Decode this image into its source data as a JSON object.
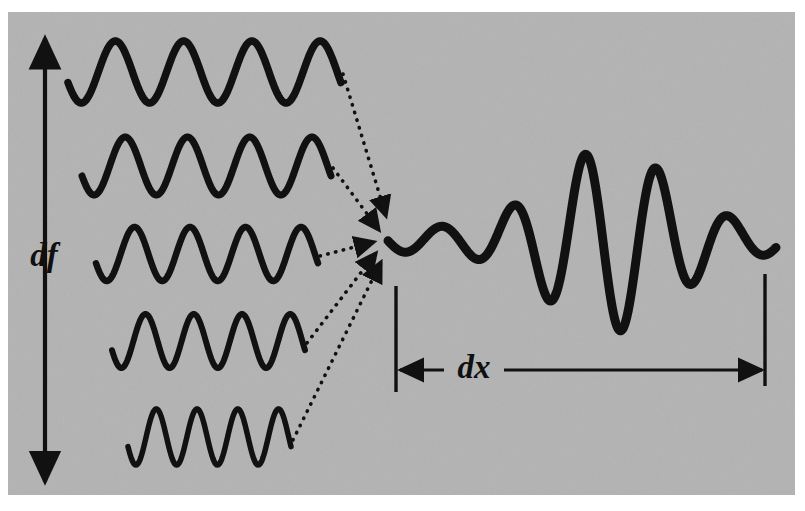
{
  "figure": {
    "background_color": "#b3b3b3",
    "ink_color": "#111111",
    "page_color": "#ffffff",
    "canvas": {
      "width": 805,
      "height": 511
    },
    "plate": {
      "x": 8,
      "y": 12,
      "width": 787,
      "height": 483
    }
  },
  "labels": {
    "df": "df",
    "dx": "dx"
  },
  "annotations": {
    "df_axis": {
      "name": "frequency-spread-axis",
      "orientation": "vertical",
      "double_headed": true,
      "x": 45,
      "y_top": 38,
      "y_bottom": 482,
      "label": "df",
      "label_x": 44,
      "label_y": 266
    },
    "dx_axis": {
      "name": "position-spread-axis",
      "orientation": "horizontal",
      "double_headed": true,
      "y": 370,
      "x_left": 400,
      "x_right": 762,
      "label": "dx",
      "label_x": 474,
      "label_y": 378,
      "tick_left": {
        "x": 396,
        "y_top": 286,
        "y_bottom": 392
      },
      "tick_right": {
        "x": 765,
        "y_top": 274,
        "y_bottom": 386
      }
    }
  },
  "component_waves": [
    {
      "name": "component-wave-1",
      "x_start": 68,
      "x_end": 341,
      "y_center": 72,
      "amplitude": 31,
      "cycles": 4.0,
      "phase_deg": 200,
      "stroke_width": 7.5
    },
    {
      "name": "component-wave-2",
      "x_start": 82,
      "x_end": 331,
      "y_center": 166,
      "amplitude": 29,
      "cycles": 4.0,
      "phase_deg": 200,
      "stroke_width": 7.0
    },
    {
      "name": "component-wave-3",
      "x_start": 96,
      "x_end": 318,
      "y_center": 254,
      "amplitude": 27,
      "cycles": 4.0,
      "phase_deg": 200,
      "stroke_width": 6.5
    },
    {
      "name": "component-wave-4",
      "x_start": 112,
      "x_end": 305,
      "y_center": 341,
      "amplitude": 27,
      "cycles": 4.0,
      "phase_deg": 200,
      "stroke_width": 6.0
    },
    {
      "name": "component-wave-5",
      "x_start": 128,
      "x_end": 291,
      "y_center": 437,
      "amplitude": 28,
      "cycles": 4.0,
      "phase_deg": 200,
      "stroke_width": 5.5
    }
  ],
  "dotted_arrows": [
    {
      "name": "sum-arrow-1",
      "from_x": 343,
      "from_y": 74,
      "to_x": 386,
      "to_y": 216
    },
    {
      "name": "sum-arrow-2",
      "from_x": 333,
      "from_y": 168,
      "to_x": 379,
      "to_y": 230
    },
    {
      "name": "sum-arrow-3",
      "from_x": 320,
      "from_y": 256,
      "to_x": 374,
      "to_y": 242
    },
    {
      "name": "sum-arrow-4",
      "from_x": 307,
      "from_y": 343,
      "to_x": 376,
      "to_y": 253
    },
    {
      "name": "sum-arrow-5",
      "from_x": 293,
      "from_y": 440,
      "to_x": 381,
      "to_y": 262
    }
  ],
  "wave_packet": {
    "name": "resultant-wave-packet",
    "x_start": 388,
    "x_end": 776,
    "y_center": 240,
    "peak_amplitude": 92,
    "envelope_center_x": 610,
    "envelope_sigma": 86,
    "carrier_cycles": 5.4,
    "stroke_width": 9
  },
  "chart_data": {
    "type": "line",
    "xlabel": "",
    "ylabel": "",
    "series": [
      {
        "name": "component-wave-1",
        "frequency_rank": 1,
        "cycles_drawn": 4.0,
        "relative_wavelength": 1.0
      },
      {
        "name": "component-wave-2",
        "frequency_rank": 2,
        "cycles_drawn": 4.0,
        "relative_wavelength": 0.91
      },
      {
        "name": "component-wave-3",
        "frequency_rank": 3,
        "cycles_drawn": 4.0,
        "relative_wavelength": 0.81
      },
      {
        "name": "component-wave-4",
        "frequency_rank": 4,
        "cycles_drawn": 4.0,
        "relative_wavelength": 0.71
      },
      {
        "name": "component-wave-5",
        "frequency_rank": 5,
        "cycles_drawn": 4.0,
        "relative_wavelength": 0.6
      },
      {
        "name": "resultant-wave-packet",
        "cycles_drawn": 5.4,
        "relative_wavelength": 0.8
      }
    ],
    "annotations": [
      "df",
      "dx"
    ],
    "legend": "none",
    "grid": false
  }
}
